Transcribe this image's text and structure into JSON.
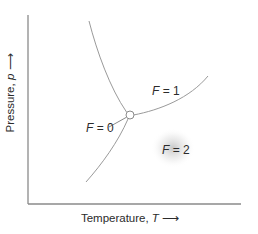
{
  "diagram": {
    "type": "phase-diagram",
    "axes": {
      "ylabel": "Pressure, p",
      "ylabel_var": "p",
      "xlabel": "Temperature, T",
      "xlabel_var": "T",
      "arrow": "⟶"
    },
    "labels": {
      "f0": {
        "var": "F",
        "eq": " = 0"
      },
      "f1": {
        "var": "F",
        "eq": " = 1"
      },
      "f2": {
        "var": "F",
        "eq": " = 2"
      }
    },
    "colors": {
      "axis": "#8a8a8a",
      "curve": "#9a9a9a",
      "text": "#2b2b2b",
      "glow": "#c8c8c8"
    }
  }
}
